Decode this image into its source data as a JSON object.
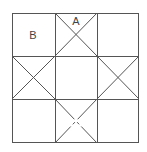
{
  "diagram": {
    "type": "quilt-block-grid",
    "rows": 3,
    "cols": 3,
    "line_color": "#555555",
    "background": "#ffffff",
    "grid": {
      "x": [
        12,
        55,
        97,
        139
      ],
      "y": [
        13,
        56,
        99,
        143
      ]
    },
    "labels": [
      {
        "text": "A",
        "x": 76,
        "y": 21,
        "cell": "top-middle"
      },
      {
        "text": "B",
        "x": 33,
        "y": 35,
        "cell": "top-left"
      }
    ],
    "diagonal_cells": [
      "top-middle",
      "middle-left",
      "middle-right",
      "bottom-middle"
    ]
  }
}
